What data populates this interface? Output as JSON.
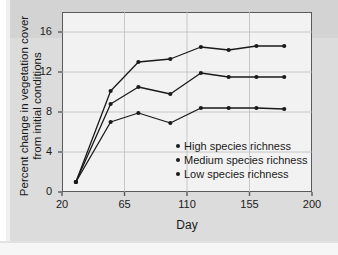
{
  "chart_data": {
    "type": "line",
    "title": "",
    "xlabel": "Day",
    "ylabel": "Percent change in vegetation cover from initial conditions",
    "ylabel_lines": [
      "Percent change in vegetation cover",
      "from initial conditions"
    ],
    "xlim": [
      20,
      200
    ],
    "ylim": [
      0,
      18
    ],
    "xticks": [
      20,
      65,
      110,
      155,
      200
    ],
    "yticks": [
      0,
      4,
      8,
      12,
      16
    ],
    "grid": true,
    "legend_position": "inside-lower-right",
    "x": [
      30,
      55,
      75,
      98,
      120,
      140,
      160,
      180
    ],
    "series": [
      {
        "name": "High species richness",
        "label": "High species richness",
        "color": "#1a1a1a",
        "values": [
          1.0,
          10.1,
          13.0,
          13.3,
          14.5,
          14.2,
          14.6,
          14.6
        ]
      },
      {
        "name": "Medium species richness",
        "label": "Medium species richness",
        "color": "#1a1a1a",
        "values": [
          1.0,
          8.8,
          10.5,
          9.8,
          11.9,
          11.5,
          11.5,
          11.5
        ]
      },
      {
        "name": "Low species richness",
        "label": "Low species richness",
        "color": "#1a1a1a",
        "values": [
          1.0,
          7.0,
          7.9,
          6.9,
          8.4,
          8.4,
          8.4,
          8.3
        ]
      }
    ]
  },
  "axis": {
    "xticks_text": [
      "20",
      "65",
      "110",
      "155",
      "200"
    ],
    "yticks_text": [
      "0",
      "4",
      "8",
      "12",
      "16"
    ],
    "xtitle": "Day",
    "ytitle_line1": "Percent change in vegetation cover",
    "ytitle_line2": "from initial conditions"
  },
  "legend": {
    "items": [
      {
        "label": "High species richness"
      },
      {
        "label": "Medium species richness"
      },
      {
        "label": "Low species richness"
      }
    ]
  },
  "colors": {
    "ink": "#1a1a1a",
    "frame": "#58595b",
    "grid": "#bcbcbc",
    "plot_bg": "#f2f2f2",
    "page_bg": "#dcdcdc"
  }
}
